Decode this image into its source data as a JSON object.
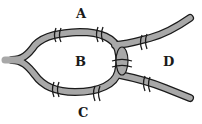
{
  "diagram": {
    "labels": {
      "A": "A",
      "B": "B",
      "C": "C",
      "D": "D"
    },
    "river_color": "#a8a8a8",
    "outline_color": "#1a1a1a",
    "bridge_count": 7
  }
}
